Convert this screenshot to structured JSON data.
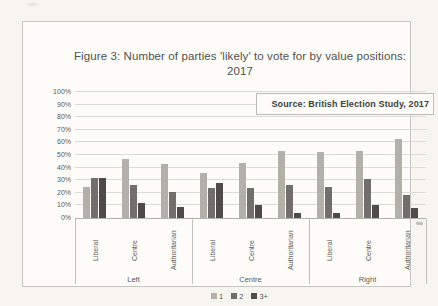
{
  "chart_data": {
    "type": "bar",
    "title": "Figure 3: Number of parties 'likely' to vote for by value positions: 2017",
    "annotation": "Source: British Election Study, 2017",
    "group_labels": [
      "Left",
      "Centre",
      "Right"
    ],
    "category_labels": [
      "Liberal",
      "Centre",
      "Authoritarian",
      "Liberal",
      "Centre",
      "Authoritarian",
      "Liberal",
      "Centre",
      "Authoritarian"
    ],
    "yticks": [
      "0%",
      "10%",
      "20%",
      "30%",
      "40%",
      "50%",
      "60%",
      "70%",
      "80%",
      "90%",
      "100%"
    ],
    "ylim": [
      0,
      100
    ],
    "grid": true,
    "legend_position": "bottom",
    "series": [
      {
        "name": "1",
        "color": "#b3b0aa",
        "values": [
          25,
          47,
          43,
          36,
          44,
          53,
          52,
          53,
          63
        ]
      },
      {
        "name": "2",
        "color": "#716f6b",
        "values": [
          32,
          26,
          21,
          24,
          24,
          26,
          25,
          31,
          18
        ]
      },
      {
        "name": "3+",
        "color": "#4e4c48",
        "values": [
          32,
          12,
          9,
          28,
          10,
          4,
          4,
          10,
          8
        ]
      }
    ]
  },
  "page": {
    "background": "#f7f5f0",
    "chart_fill": "#fdfcf9",
    "gridline_color": "#dcdad5",
    "axis_color": "#b2b0ac"
  }
}
